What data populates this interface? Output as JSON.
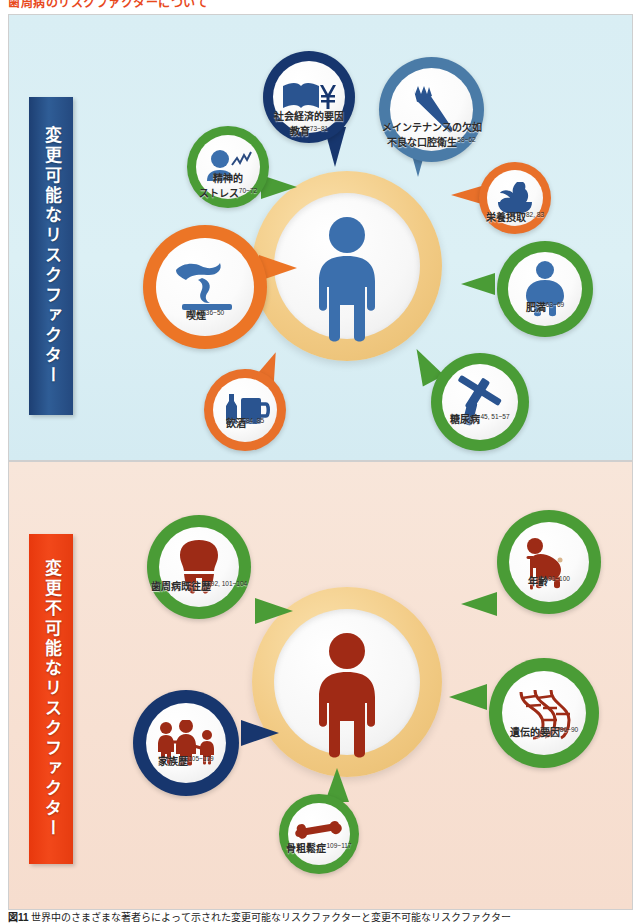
{
  "document": {
    "top_heading": "歯周病のリスクファクターについて",
    "caption_figure_no": "図11",
    "caption_text": "世界中のさまざまな著者らによって示された変更可能なリスクファクターと変更不可能なリスクファクター"
  },
  "panels": [
    {
      "id": "modifiable",
      "sidebar_label": "変更可能なリスクファクター",
      "sidebar_color": "#24497f",
      "background_color": "#d9eef4",
      "figure_color": "#3b6fad",
      "bubbles": [
        {
          "id": "socioeconomic",
          "label_line1": "社会経済的要因",
          "label_line2": "教育",
          "refs": "73~81",
          "ring_color": "#17366e",
          "icon": "book-yen-icon"
        },
        {
          "id": "maintenance",
          "label_line1": "メインテナンスの欠如",
          "label_line2": "不良な口腔衛生",
          "refs": "58~62",
          "ring_color": "#4a7ba7",
          "icon": "toothbrush-icon"
        },
        {
          "id": "nutrition",
          "label_line1": "栄養摂取",
          "label_line2": "",
          "refs": "82, 83",
          "ring_color": "#e8702a",
          "icon": "vegetable-bowl-icon"
        },
        {
          "id": "stress",
          "label_line1": "精神的",
          "label_line2": "ストレス",
          "refs": "70~72",
          "ring_color": "#4a9c36",
          "icon": "stress-person-icon"
        },
        {
          "id": "smoking",
          "label_line1": "喫煙",
          "label_line2": "",
          "refs": "36~50",
          "ring_color": "#ec7526",
          "icon": "cigarette-smoke-icon"
        },
        {
          "id": "alcohol",
          "label_line1": "飲酒",
          "label_line2": "",
          "refs": "84, 85",
          "ring_color": "#e8702a",
          "icon": "sake-bottle-mug-icon"
        },
        {
          "id": "diabetes",
          "label_line1": "糖尿病",
          "label_line2": "",
          "refs": "45, 51~57",
          "ring_color": "#4a9c36",
          "icon": "syringe-icon"
        },
        {
          "id": "obesity",
          "label_line1": "肥満",
          "label_line2": "",
          "refs": "63~69",
          "ring_color": "#4a9c36",
          "icon": "obese-person-icon"
        }
      ]
    },
    {
      "id": "non-modifiable",
      "sidebar_label": "変更不可能なリスクファクター",
      "sidebar_color": "#e8380d",
      "background_color": "#f7e2d5",
      "figure_color": "#a02a15",
      "bubbles": [
        {
          "id": "periodontal-history",
          "label_line1": "歯周病既往歴",
          "label_line2": "",
          "refs": "92, 101~104",
          "ring_color": "#4a9c36",
          "icon": "tooth-icon"
        },
        {
          "id": "age",
          "label_line1": "年齢",
          "label_line2": "",
          "refs": "91~100",
          "ring_color": "#4a9c36",
          "icon": "elderly-person-icon"
        },
        {
          "id": "genetic",
          "label_line1": "遺伝的要因",
          "label_line2": "",
          "refs": "86~90",
          "ring_color": "#4a9c36",
          "icon": "dna-icon"
        },
        {
          "id": "osteoporosis",
          "label_line1": "骨粗鬆症",
          "label_line2": "",
          "refs": "109~117",
          "ring_color": "#4a9c36",
          "icon": "bone-icon"
        },
        {
          "id": "family-history",
          "label_line1": "家族歴",
          "label_line2": "",
          "refs": "105~109",
          "ring_color": "#17366e",
          "icon": "family-icon"
        }
      ]
    }
  ]
}
